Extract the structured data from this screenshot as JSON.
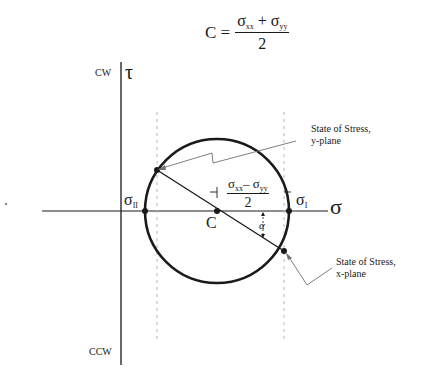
{
  "formula": {
    "lhs": "C =",
    "numerator_a": "σ",
    "numerator_a_sub": "xx",
    "plus": " + ",
    "numerator_b": "σ",
    "numerator_b_sub": "yy",
    "denominator": "2"
  },
  "axes": {
    "tau_label": "τ",
    "sigma_label": "σ",
    "cw_label": "CW",
    "ccw_label": "CCW"
  },
  "points": {
    "sigma_II": "σ",
    "sigma_II_sub": "II",
    "sigma_I": "σ",
    "sigma_I_sub": "I",
    "center": "C",
    "alpha": "α"
  },
  "half_difference": {
    "numerator_a": "σ",
    "numerator_a_sub": "xx",
    "minus": "– ",
    "numerator_b": "σ",
    "numerator_b_sub": "yy",
    "denominator": "2"
  },
  "annotations": {
    "y_plane_line1": "State of Stress,",
    "y_plane_line2": "y-plane",
    "x_plane_line1": "State of Stress,",
    "x_plane_line2": "x-plane"
  },
  "colors": {
    "stroke": "#1a1a1a",
    "dashed": "#b0b0b0",
    "leader": "#707070"
  }
}
